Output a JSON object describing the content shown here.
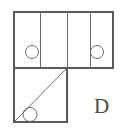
{
  "figure": {
    "label": "D",
    "label_position": {
      "x": 94,
      "y": 96
    },
    "canvas": {
      "width": 126,
      "height": 136
    },
    "stroke_color": "#6b6b6b",
    "fill_color": "#ffffff",
    "background_color": "#ffffff",
    "top_row": {
      "x": 14,
      "y": 12,
      "width": 99,
      "height": 56,
      "divider_x": [
        40,
        67,
        90
      ],
      "cells": [
        {
          "index": 0,
          "x": 14,
          "width": 26,
          "circle": {
            "cx": 32,
            "cy": 52,
            "r": 6.5
          }
        },
        {
          "index": 1,
          "x": 40,
          "width": 27,
          "circle": null
        },
        {
          "index": 2,
          "x": 67,
          "width": 23,
          "circle": null
        },
        {
          "index": 3,
          "x": 90,
          "width": 23,
          "circle": {
            "cx": 97,
            "cy": 52,
            "r": 6.5
          }
        }
      ]
    },
    "bottom_square": {
      "x": 14,
      "y": 68,
      "width": 53,
      "height": 54,
      "diagonal": {
        "x1": 15,
        "y1": 121,
        "x2": 66,
        "y2": 69
      },
      "circle": {
        "cx": 30,
        "cy": 114.5,
        "r": 7
      }
    }
  }
}
